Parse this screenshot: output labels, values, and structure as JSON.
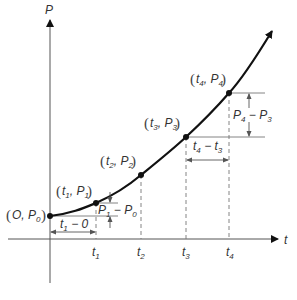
{
  "diagram": {
    "y_axis_label": "P",
    "x_axis_label": "t",
    "colors": {
      "curve": "#111111",
      "axis": "#555555",
      "guide": "#777777",
      "text": "#333333",
      "background": "#ffffff"
    },
    "points": [
      {
        "id": "P0",
        "t_label": "O",
        "p_label": "P",
        "p_sub": "0",
        "label": "(O, P0)"
      },
      {
        "id": "P1",
        "t_label": "t",
        "t_sub": "1",
        "p_label": "P",
        "p_sub": "1",
        "label": "(t1, P1)"
      },
      {
        "id": "P2",
        "t_label": "t",
        "t_sub": "2",
        "p_label": "P",
        "p_sub": "2",
        "label": "(t2, P2)"
      },
      {
        "id": "P3",
        "t_label": "t",
        "t_sub": "3",
        "p_label": "P",
        "p_sub": "3",
        "label": "(t3, P3)"
      },
      {
        "id": "P4",
        "t_label": "t",
        "t_sub": "4",
        "p_label": "P",
        "p_sub": "4",
        "label": "(t4, P4)"
      }
    ],
    "x_ticks": [
      {
        "main": "t",
        "sub": "1"
      },
      {
        "main": "t",
        "sub": "2"
      },
      {
        "main": "t",
        "sub": "3"
      },
      {
        "main": "t",
        "sub": "4"
      }
    ],
    "annotations": {
      "dt1": {
        "a": "t",
        "a_sub": "1",
        "op": "−",
        "b": "0",
        "text": "t1 − 0"
      },
      "dp1": {
        "a": "P",
        "a_sub": "1",
        "op": "−",
        "b": "P",
        "b_sub": "0",
        "text": "P1 − P0"
      },
      "dt4": {
        "a": "t",
        "a_sub": "4",
        "op": "−",
        "b": "t",
        "b_sub": "3",
        "text": "t4 − t3"
      },
      "dp4": {
        "a": "P",
        "a_sub": "4",
        "op": "−",
        "b": "P",
        "b_sub": "3",
        "text": "P4 − P3"
      }
    }
  }
}
